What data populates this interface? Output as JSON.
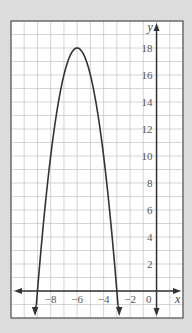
{
  "chart_data": {
    "type": "line",
    "title": "",
    "xlabel": "x",
    "ylabel": "y",
    "function": "y = -2(x+6)^2 + 18",
    "vertex": [
      -6,
      18
    ],
    "x_intercepts": [
      -9,
      -3
    ],
    "xlim": [
      -11,
      2
    ],
    "ylim": [
      -2,
      20
    ],
    "grid": true,
    "grid_step": 1,
    "x_tick_labels": [
      "-8",
      "-6",
      "-4",
      "-2",
      "0"
    ],
    "x_ticks": [
      -8,
      -6,
      -4,
      -2,
      0
    ],
    "y_tick_labels": [
      "2",
      "4",
      "6",
      "8",
      "10",
      "12",
      "14",
      "16",
      "18"
    ],
    "y_ticks": [
      2,
      4,
      6,
      8,
      10,
      12,
      14,
      16,
      18
    ],
    "series": [
      {
        "name": "parabola",
        "x": [
          -9.5,
          -9,
          -8.5,
          -8,
          -7.5,
          -7,
          -6.5,
          -6,
          -5.5,
          -5,
          -4.5,
          -4,
          -3.5,
          -3,
          -2.5
        ],
        "y": [
          -6.5,
          0,
          5.5,
          10,
          13.5,
          16,
          17.5,
          18,
          17.5,
          16,
          13.5,
          10,
          5.5,
          0,
          -6.5
        ]
      }
    ],
    "colors": {
      "background": "#dcdcdc",
      "plot_bg": "#ffffff",
      "grid": "#b8b8b8",
      "curve": "#333333",
      "axes": "#333333"
    }
  }
}
